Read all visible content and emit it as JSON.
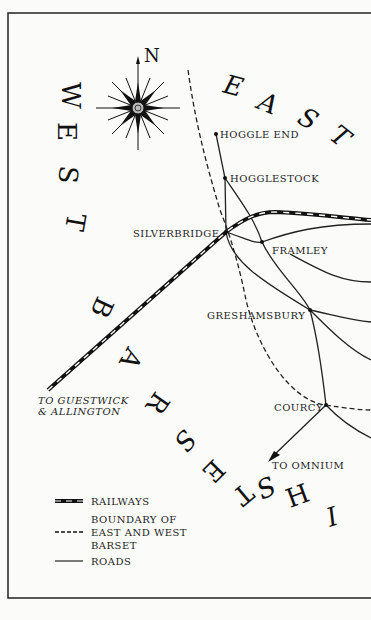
{
  "map": {
    "region_east": "EAST",
    "region_west": "WEST",
    "county": "BARSETSHIRE",
    "compass_north": "N",
    "towns": {
      "hoggle_end": "HOGGLE END",
      "hogglestock": "HOGGLESTOCK",
      "silverbridge": "SILVERBRIDGE",
      "framley": "FRAMLEY",
      "greshamsbury": "GRESHAMSBURY",
      "courcy": "COURCY"
    },
    "destinations": {
      "guestwick_line1": "TO GUESTWICK",
      "guestwick_line2": "& ALLINGTON",
      "omnium": "TO OMNIUM"
    }
  },
  "legend": {
    "railways": "RAILWAYS",
    "boundary_line1": "BOUNDARY OF",
    "boundary_line2": "EAST AND WEST",
    "boundary_line3": "BARSET",
    "roads": "ROADS"
  },
  "colors": {
    "ink": "#111111",
    "paper": "#fbfbf9"
  }
}
